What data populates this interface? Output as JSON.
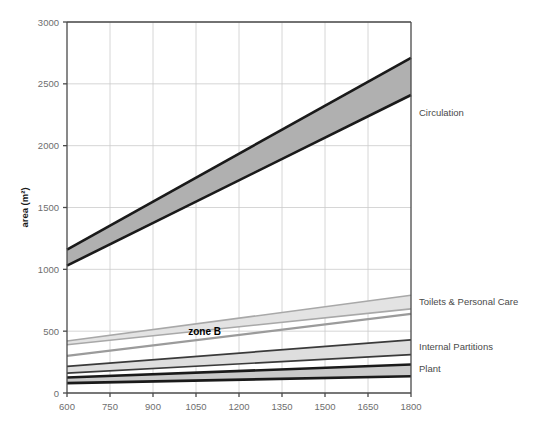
{
  "chart_data": {
    "type": "area",
    "title": "",
    "xlabel": "",
    "ylabel": "area (m²)",
    "xlim": [
      600,
      1800
    ],
    "ylim": [
      0,
      3000
    ],
    "grid": true,
    "legend_position": "right-inline",
    "x_ticks": [
      600,
      750,
      900,
      1050,
      1200,
      1350,
      1500,
      1650,
      1800
    ],
    "y_ticks": [
      0,
      500,
      1000,
      1500,
      2000,
      2500,
      3000
    ],
    "x": [
      600,
      1800
    ],
    "annotations": [
      {
        "text": "zone B",
        "x": 1080,
        "y": 500,
        "bold": true
      }
    ],
    "series": [
      {
        "name": "Circulation",
        "label": "Circulation",
        "type": "band",
        "lower": [
          1030,
          2410
        ],
        "upper": [
          1160,
          2710
        ],
        "fill": "#b0b0b0",
        "stroke": "#1a1a1a",
        "stroke_width": 2.6,
        "label_y": 2270
      },
      {
        "name": "Toilets & Personal Care",
        "label": "Toilets & Personal Care",
        "type": "band",
        "lower": [
          390,
          680
        ],
        "upper": [
          420,
          790
        ],
        "fill": "#e3e3e3",
        "stroke": "#a8a8a8",
        "stroke_width": 1.6,
        "label_y": 740
      },
      {
        "name": "zone B line",
        "label": "",
        "type": "line",
        "values": [
          300,
          640
        ],
        "stroke": "#9b9b9b",
        "stroke_width": 2.2
      },
      {
        "name": "Internal Partitions",
        "label": "Internal Partitions",
        "type": "band",
        "lower": [
          160,
          310
        ],
        "upper": [
          215,
          430
        ],
        "fill": "#dedede",
        "stroke": "#3a3a3a",
        "stroke_width": 1.7,
        "label_y": 380
      },
      {
        "name": "Plant",
        "label": "Plant",
        "type": "band",
        "lower": [
          80,
          135
        ],
        "upper": [
          125,
          230
        ],
        "fill": "#c9c9c9",
        "stroke": "#1a1a1a",
        "stroke_width": 2.6,
        "label_y": 200
      }
    ],
    "colors": {
      "axis": "#4a4a4a",
      "grid": "#cccccc",
      "tick_text": "#6e6e6e",
      "label_text": "#4a4a4a",
      "background": "#ffffff"
    }
  }
}
